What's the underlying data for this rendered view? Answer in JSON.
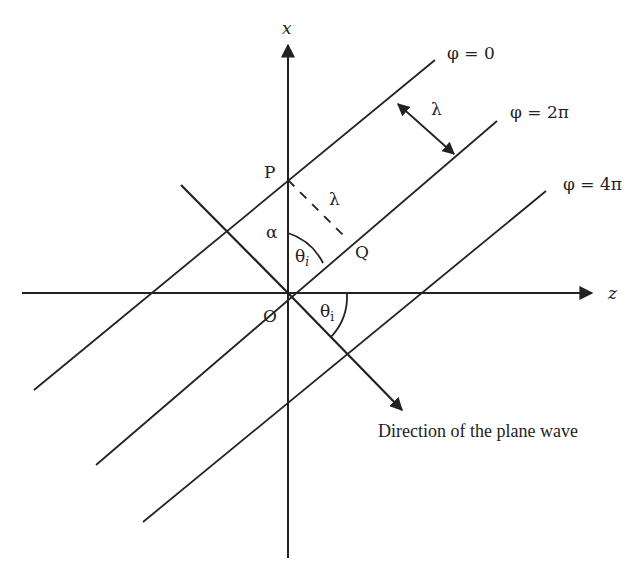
{
  "diagram": {
    "axes": {
      "x_label": "x",
      "z_label": "z",
      "origin_label": "O"
    },
    "wavefronts": [
      {
        "label": "φ = 0"
      },
      {
        "label": "φ = 2π"
      },
      {
        "label": "φ = 4π"
      }
    ],
    "points": {
      "P": "P",
      "Q": "Q"
    },
    "angles": {
      "alpha": "α",
      "theta_upper": "θ",
      "theta_upper_sub": "i",
      "theta_lower": "θ",
      "theta_lower_sub": "i"
    },
    "wavelength_labels": {
      "between_fronts": "λ",
      "PQ_dashed": "λ"
    },
    "direction_caption": "Direction of the plane wave",
    "colors": {
      "stroke": "#222222",
      "background": "#ffffff"
    }
  }
}
